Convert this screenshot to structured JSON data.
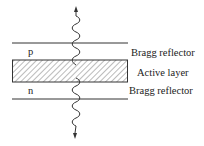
{
  "diagram": {
    "labels": {
      "p_region": "p",
      "n_region": "n",
      "top_reflector": "Bragg reflector",
      "active_layer": "Active layer",
      "bottom_reflector": "Bragg reflector"
    },
    "elements": [
      {
        "id": "top-bragg-line",
        "type": "line",
        "y": 43
      },
      {
        "id": "active-layer-box",
        "type": "hatched-rect",
        "y_top": 60,
        "y_bottom": 82
      },
      {
        "id": "bottom-bragg-line",
        "type": "line",
        "y": 99
      },
      {
        "id": "emission-up",
        "type": "wavy-arrow",
        "direction": "up"
      },
      {
        "id": "emission-down",
        "type": "wavy-arrow",
        "direction": "down"
      }
    ],
    "colors": {
      "line": "#333333",
      "hatch": "#555555",
      "text": "#222222"
    }
  }
}
